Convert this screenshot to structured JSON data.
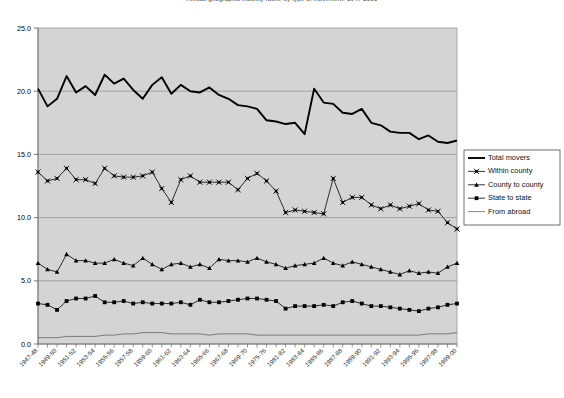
{
  "chart_data": {
    "type": "line",
    "title": "Annual geographic mobility rates, by type of movement: 1947-2000",
    "xlabel": "",
    "ylabel": "",
    "ylim": [
      0.0,
      25.0
    ],
    "yticks": [
      "0.0",
      "5.0",
      "10.0",
      "15.0",
      "20.0",
      "25.0"
    ],
    "grid": true,
    "legend_position": "right",
    "plot_bg": "#d4d4d4",
    "categories": [
      "1947-48",
      "1948-49",
      "1949-50",
      "1950-51",
      "1951-52",
      "1952-53",
      "1953-54",
      "1954-55",
      "1955-56",
      "1956-57",
      "1957-58",
      "1958-59",
      "1959-60",
      "1960-61",
      "1961-62",
      "1962-63",
      "1963-64",
      "1964-65",
      "1965-66",
      "1966-67",
      "1967-68",
      "1968-69",
      "1969-70",
      "1970-71",
      "1975-76",
      "1976-77",
      "1981-82",
      "1982-83",
      "1983-84",
      "1984-85",
      "1985-86",
      "1986-87",
      "1987-88",
      "1988-89",
      "1989-90",
      "1990-91",
      "1991-92",
      "1992-93",
      "1993-94",
      "1994-95",
      "1995-96",
      "1996-97",
      "1997-98",
      "1998-99",
      "1999-00"
    ],
    "xtick_labels": [
      "1947-48",
      "1949-50",
      "1951-52",
      "1953-54",
      "1955-56",
      "1957-58",
      "1959-60",
      "1961-62",
      "1963-64",
      "1965-66",
      "1967-68",
      "1969-70",
      "1975-76",
      "1981-82",
      "1983-84",
      "1985-86",
      "1987-88",
      "1989-90",
      "1991-92",
      "1993-94",
      "1995-96",
      "1997-98",
      "1999-00"
    ],
    "series": [
      {
        "name": "Total movers",
        "marker": "none",
        "color": "#000000",
        "width": 1.9,
        "values": [
          20.2,
          18.8,
          19.4,
          21.2,
          19.9,
          20.4,
          19.7,
          21.3,
          20.6,
          21.0,
          20.1,
          19.4,
          20.5,
          21.1,
          19.8,
          20.5,
          20.0,
          19.9,
          20.3,
          19.7,
          19.4,
          18.9,
          18.8,
          18.6,
          17.7,
          17.6,
          17.4,
          17.5,
          16.6,
          20.2,
          19.1,
          19.0,
          18.3,
          18.2,
          18.6,
          17.5,
          17.3,
          16.8,
          16.7,
          16.7,
          16.2,
          16.5,
          16.0,
          15.9,
          16.1
        ]
      },
      {
        "name": "Within county",
        "marker": "cross",
        "color": "#000000",
        "width": 0.8,
        "values": [
          13.6,
          12.9,
          13.1,
          13.9,
          13.0,
          13.0,
          12.7,
          13.9,
          13.3,
          13.2,
          13.2,
          13.3,
          13.6,
          12.3,
          11.2,
          13.0,
          13.3,
          12.8,
          12.8,
          12.8,
          12.8,
          12.2,
          13.1,
          13.5,
          12.9,
          12.1,
          10.4,
          10.6,
          10.5,
          10.4,
          10.3,
          13.1,
          11.2,
          11.6,
          11.6,
          11.0,
          10.7,
          11.0,
          10.7,
          10.9,
          11.1,
          10.6,
          10.5,
          9.6,
          9.1
        ]
      },
      {
        "name": "County to county",
        "marker": "triangle",
        "color": "#000000",
        "width": 0.8,
        "values": [
          6.4,
          5.9,
          5.7,
          7.1,
          6.6,
          6.6,
          6.4,
          6.4,
          6.7,
          6.4,
          6.2,
          6.8,
          6.3,
          5.9,
          6.3,
          6.4,
          6.1,
          6.3,
          6.0,
          6.7,
          6.6,
          6.6,
          6.5,
          6.8,
          6.5,
          6.3,
          6.0,
          6.2,
          6.3,
          6.4,
          6.8,
          6.4,
          6.2,
          6.5,
          6.3,
          6.1,
          5.9,
          5.7,
          5.5,
          5.8,
          5.6,
          5.7,
          5.6,
          6.1,
          6.4
        ]
      },
      {
        "name": "State to state",
        "marker": "square",
        "color": "#000000",
        "width": 0.8,
        "values": [
          3.2,
          3.1,
          2.7,
          3.4,
          3.6,
          3.6,
          3.8,
          3.3,
          3.3,
          3.4,
          3.2,
          3.3,
          3.2,
          3.2,
          3.2,
          3.3,
          3.1,
          3.5,
          3.3,
          3.3,
          3.4,
          3.5,
          3.6,
          3.6,
          3.5,
          3.4,
          2.8,
          3.0,
          3.0,
          3.0,
          3.1,
          3.0,
          3.3,
          3.4,
          3.2,
          3.0,
          3.0,
          2.9,
          2.8,
          2.7,
          2.6,
          2.8,
          2.9,
          3.1,
          3.2
        ]
      },
      {
        "name": "From abroad",
        "marker": "none",
        "color": "#555555",
        "width": 0.7,
        "values": [
          0.5,
          0.5,
          0.5,
          0.6,
          0.6,
          0.6,
          0.6,
          0.7,
          0.7,
          0.8,
          0.8,
          0.9,
          0.9,
          0.9,
          0.8,
          0.8,
          0.8,
          0.8,
          0.7,
          0.8,
          0.8,
          0.8,
          0.8,
          0.7,
          0.7,
          0.7,
          0.7,
          0.7,
          0.7,
          0.7,
          0.7,
          0.7,
          0.7,
          0.7,
          0.7,
          0.7,
          0.7,
          0.7,
          0.7,
          0.7,
          0.7,
          0.8,
          0.8,
          0.8,
          0.9
        ]
      }
    ]
  },
  "legend": {
    "items": [
      {
        "label": "Total movers",
        "marker": "none"
      },
      {
        "label": "Within county",
        "marker": "cross"
      },
      {
        "label": "County to county",
        "marker": "triangle"
      },
      {
        "label": "State to state",
        "marker": "square"
      },
      {
        "label": "From abroad",
        "marker": "none"
      }
    ]
  }
}
